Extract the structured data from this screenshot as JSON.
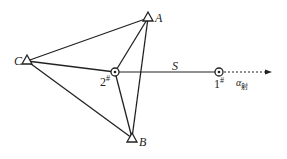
{
  "diagram": {
    "nodes": {
      "A": {
        "label": "A",
        "x": 148,
        "y": 18,
        "shape": "triangle"
      },
      "B": {
        "label": "B",
        "x": 132,
        "y": 138,
        "shape": "triangle"
      },
      "C": {
        "label": "C",
        "x": 27,
        "y": 61,
        "shape": "triangle"
      },
      "station2": {
        "label": "2",
        "sup": "#",
        "x": 115,
        "y": 72,
        "shape": "circle-dot"
      },
      "station1": {
        "label": "1",
        "sup": "#",
        "x": 219,
        "y": 72,
        "shape": "circle-dot"
      }
    },
    "edges": [
      [
        "C",
        "A"
      ],
      [
        "C",
        "B"
      ],
      [
        "A",
        "B"
      ],
      [
        "C",
        "station2"
      ],
      [
        "A",
        "station2"
      ],
      [
        "B",
        "station2"
      ],
      [
        "station2",
        "station1"
      ]
    ],
    "distance_label": "S",
    "direction_label": "α",
    "direction_sub": "射",
    "line_color": "#222222"
  }
}
